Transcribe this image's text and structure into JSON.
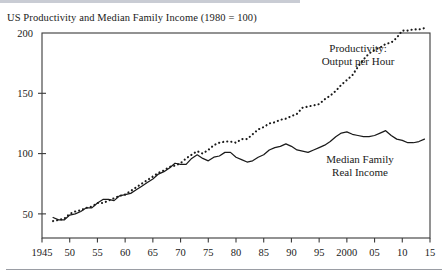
{
  "chart_title": "US Productivity and Median Family Income (1980 = 100)",
  "annotations": {
    "productivity_line1": "Productivity:",
    "productivity_line2": "Output per Hour",
    "income_line1": "Median Family",
    "income_line2": "Real Income"
  },
  "axis": {
    "y_ticks": [
      "50",
      "100",
      "150",
      "200"
    ],
    "x_ticks": [
      "1945",
      "50",
      "55",
      "60",
      "65",
      "70",
      "75",
      "80",
      "85",
      "90",
      "95",
      "2000",
      "05",
      "10",
      "15"
    ]
  },
  "colors": {
    "line": "#1a1a1a",
    "axis": "#3a3a3a",
    "background": "#ffffff",
    "rule": "#9a9da4"
  },
  "chart_data": {
    "type": "line",
    "title": "US Productivity and Median Family Income (1980 = 100)",
    "xlabel": "",
    "ylabel": "",
    "xlim": [
      1945,
      2015
    ],
    "ylim": [
      30,
      200
    ],
    "grid": false,
    "legend_position": "inline-annotation",
    "y_tick_values": [
      50,
      100,
      150,
      200
    ],
    "x_tick_values": [
      1945,
      1950,
      1955,
      1960,
      1965,
      1970,
      1975,
      1980,
      1985,
      1990,
      1995,
      2000,
      2005,
      2010,
      2015
    ],
    "x_tick_labels": [
      "1945",
      "50",
      "55",
      "60",
      "65",
      "70",
      "75",
      "80",
      "85",
      "90",
      "95",
      "2000",
      "05",
      "10",
      "15"
    ],
    "series": [
      {
        "name": "Productivity: Output per Hour",
        "style": "dotted",
        "x": [
          1947,
          1948,
          1949,
          1950,
          1951,
          1952,
          1953,
          1954,
          1955,
          1956,
          1957,
          1958,
          1959,
          1960,
          1961,
          1962,
          1963,
          1964,
          1965,
          1966,
          1967,
          1968,
          1969,
          1970,
          1971,
          1972,
          1973,
          1974,
          1975,
          1976,
          1977,
          1978,
          1979,
          1980,
          1981,
          1982,
          1983,
          1984,
          1985,
          1986,
          1987,
          1988,
          1989,
          1990,
          1991,
          1992,
          1993,
          1994,
          1995,
          1996,
          1997,
          1998,
          1999,
          2000,
          2001,
          2002,
          2003,
          2004,
          2005,
          2006,
          2007,
          2008,
          2009,
          2010,
          2011,
          2012,
          2013,
          2014
        ],
        "values": [
          44,
          45,
          46,
          50,
          52,
          53,
          55,
          56,
          59,
          59,
          61,
          63,
          65,
          66,
          69,
          72,
          75,
          78,
          81,
          84,
          86,
          89,
          90,
          92,
          96,
          99,
          102,
          100,
          103,
          107,
          109,
          110,
          110,
          109,
          112,
          112,
          116,
          120,
          122,
          125,
          126,
          128,
          129,
          131,
          133,
          138,
          139,
          140,
          141,
          145,
          148,
          152,
          157,
          161,
          165,
          172,
          178,
          183,
          186,
          188,
          191,
          192,
          196,
          202,
          202,
          203,
          203,
          204
        ]
      },
      {
        "name": "Median Family Real Income",
        "style": "solid",
        "x": [
          1947,
          1948,
          1949,
          1950,
          1951,
          1952,
          1953,
          1954,
          1955,
          1956,
          1957,
          1958,
          1959,
          1960,
          1961,
          1962,
          1963,
          1964,
          1965,
          1966,
          1967,
          1968,
          1969,
          1970,
          1971,
          1972,
          1973,
          1974,
          1975,
          1976,
          1977,
          1978,
          1979,
          1980,
          1981,
          1982,
          1983,
          1984,
          1985,
          1986,
          1987,
          1988,
          1989,
          1990,
          1991,
          1992,
          1993,
          1994,
          1995,
          1996,
          1997,
          1998,
          1999,
          2000,
          2001,
          2002,
          2003,
          2004,
          2005,
          2006,
          2007,
          2008,
          2009,
          2010,
          2011,
          2012,
          2013,
          2014
        ],
        "values": [
          47,
          45,
          45,
          49,
          50,
          52,
          55,
          55,
          59,
          62,
          62,
          61,
          65,
          66,
          67,
          70,
          73,
          76,
          79,
          83,
          85,
          88,
          92,
          91,
          91,
          96,
          99,
          96,
          94,
          97,
          98,
          101,
          101,
          97,
          95,
          93,
          94,
          97,
          99,
          103,
          105,
          106,
          108,
          106,
          103,
          102,
          101,
          103,
          105,
          107,
          110,
          114,
          117,
          118,
          116,
          115,
          114,
          114,
          115,
          117,
          119,
          115,
          112,
          111,
          109,
          109,
          110,
          112
        ]
      }
    ]
  }
}
